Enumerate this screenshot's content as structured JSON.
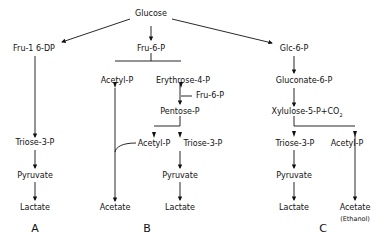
{
  "diagram": {
    "root": "Glucose",
    "pathways": {
      "A": {
        "label": "A",
        "nodes": [
          "Fru-1 6-DP",
          "Triose-3-P",
          "Pyruvate",
          "Lactate"
        ]
      },
      "B": {
        "label": "B",
        "nodes": {
          "fru6p": "Fru-6-P",
          "acetylp1": "Acetyl-P",
          "erythrose": "Erythrose-4-P",
          "fru6p_side": "Fru-6-P",
          "pentose": "Pentose-P",
          "acetylp2": "Acetyl-P",
          "triose": "Triose-3-P",
          "pyruvate": "Pyruvate",
          "acetate": "Acetate",
          "lactate": "Lactate"
        }
      },
      "C": {
        "label": "C",
        "nodes": {
          "glc6p": "Glc-6-P",
          "gluconate": "Gluconate-6-P",
          "xylulose": "Xylulose-5-P+CO",
          "xylulose_sub": "2",
          "triose": "Triose-3-P",
          "acetylp": "Acetyl-P",
          "pyruvate": "Pyruvate",
          "lactate": "Lactate",
          "acetate": "Acetate",
          "ethanol": "(Ethanol)"
        }
      }
    }
  }
}
